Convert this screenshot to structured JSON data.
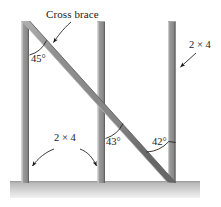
{
  "figure": {
    "background_color": "#ffffff",
    "labels": {
      "cross_brace": "Cross brace",
      "angle_left": "45°",
      "angle_middle": "43°",
      "angle_right": "42°",
      "lumber_bottom": "2 × 4",
      "lumber_right": "2 × 4"
    },
    "colors": {
      "post_fill": "#8d8d8d",
      "post_highlight": "#b9b9b9",
      "post_shadow": "#6e6e6e",
      "brace_fill": "#8a8a8a",
      "brace_shadow": "#6b6b6b",
      "ground_top": "#bdbdbd",
      "ground_bottom": "#efefef",
      "leader_line": "#1a1a1a",
      "arc_line": "#1a1a1a"
    },
    "members": [
      {
        "name": "post-left",
        "type": "vertical-post",
        "lumber": "2 × 4"
      },
      {
        "name": "post-middle",
        "type": "vertical-post",
        "lumber": "2 × 4"
      },
      {
        "name": "post-right",
        "type": "vertical-post",
        "lumber": "2 × 4"
      },
      {
        "name": "cross-brace",
        "type": "diagonal-brace",
        "lumber": "2 × 4"
      },
      {
        "name": "ground",
        "type": "ground-surface",
        "lumber": ""
      }
    ],
    "angles": [
      {
        "name": "angle-at-left-post",
        "value": "45°",
        "between": "cross-brace and post-left"
      },
      {
        "name": "angle-at-middle-post",
        "value": "43°",
        "between": "cross-brace and post-middle"
      },
      {
        "name": "angle-at-right-post",
        "value": "42°",
        "between": "cross-brace and post-right"
      }
    ]
  }
}
